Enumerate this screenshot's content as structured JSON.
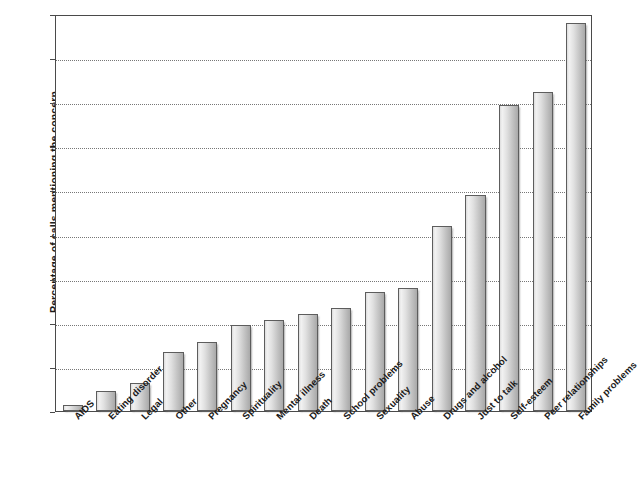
{
  "chart_data": {
    "type": "bar",
    "title": "",
    "xlabel": "",
    "ylabel": "Percentage of calls mentioning the concern",
    "ylim": [
      0,
      45
    ],
    "ytick_step": 5,
    "yticks": [
      0,
      5,
      10,
      15,
      20,
      25,
      30,
      35,
      40,
      45
    ],
    "grid": true,
    "grid_axis": "y",
    "legend": false,
    "orientation": "vertical",
    "bar_style": "grey-gradient-with-shadow",
    "categories": [
      "AIDS",
      "Eating disorder",
      "Legal",
      "Other",
      "Pregnancy",
      "Spirituality",
      "Mental illness",
      "Death",
      "School problems",
      "Sexuality",
      "Abuse",
      "Drugs and alcohol",
      "Just to talk",
      "Self-esteem",
      "Peer relationships",
      "Family problems"
    ],
    "values": [
      0.7,
      2.3,
      3.2,
      6.7,
      7.8,
      9.7,
      10.3,
      11.0,
      11.7,
      13.5,
      13.9,
      21.0,
      24.5,
      34.7,
      36.2,
      44.0
    ]
  },
  "colors": {
    "bar_light": "#f2f2f2",
    "bar_mid": "#dcdcdc",
    "bar_dark": "#a9a9a9",
    "bar_border": "#5d5d5d",
    "axis": "#4a4a4a",
    "grid": "#777777",
    "text": "#1a1a1a",
    "background": "#ffffff"
  }
}
